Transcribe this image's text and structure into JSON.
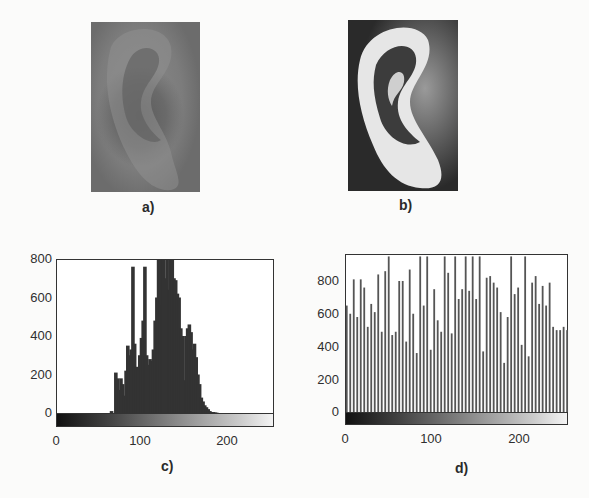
{
  "figure": {
    "panels": [
      {
        "id": "a",
        "caption": "a)",
        "description": "grayscale ear image (low contrast)"
      },
      {
        "id": "b",
        "caption": "b)",
        "description": "grayscale ear image (histogram equalized, high contrast)"
      },
      {
        "id": "c",
        "caption": "c)"
      },
      {
        "id": "d",
        "caption": "d)"
      }
    ]
  },
  "chart_data": [
    {
      "type": "bar",
      "panel": "c)",
      "title": "",
      "xlabel": "",
      "ylabel": "",
      "xlim": [
        0,
        255
      ],
      "ylim": [
        -60,
        800
      ],
      "x_ticks": [
        "0",
        "100",
        "200"
      ],
      "y_ticks": [
        "0",
        "200",
        "400",
        "600",
        "800"
      ],
      "grid": false,
      "colorbar": "grayscale 0-255 below x-axis",
      "x": [
        65,
        70,
        72,
        74,
        76,
        78,
        80,
        82,
        84,
        86,
        88,
        90,
        92,
        94,
        96,
        98,
        100,
        102,
        104,
        106,
        108,
        110,
        112,
        114,
        116,
        118,
        120,
        122,
        124,
        126,
        128,
        130,
        132,
        134,
        136,
        138,
        140,
        142,
        144,
        146,
        148,
        150,
        152,
        154,
        156,
        158,
        160,
        162,
        164,
        166,
        168,
        170,
        172,
        174,
        176,
        178,
        180,
        182,
        184,
        186,
        188,
        190
      ],
      "values": [
        10,
        210,
        180,
        120,
        180,
        150,
        90,
        220,
        350,
        300,
        330,
        760,
        360,
        240,
        230,
        300,
        390,
        480,
        760,
        300,
        250,
        280,
        270,
        330,
        480,
        600,
        800,
        800,
        560,
        800,
        700,
        800,
        640,
        800,
        800,
        700,
        690,
        620,
        600,
        440,
        400,
        170,
        400,
        440,
        460,
        420,
        330,
        360,
        290,
        200,
        150,
        80,
        60,
        40,
        30,
        20,
        10,
        5,
        5,
        3,
        2,
        0
      ]
    },
    {
      "type": "bar",
      "panel": "d)",
      "title": "",
      "xlabel": "",
      "ylabel": "",
      "xlim": [
        0,
        255
      ],
      "ylim": [
        -60,
        950
      ],
      "x_ticks": [
        "0",
        "100",
        "200"
      ],
      "y_ticks": [
        "0",
        "200",
        "400",
        "600",
        "800"
      ],
      "grid": false,
      "colorbar": "grayscale 0-255 below x-axis",
      "x": [
        2,
        6,
        10,
        14,
        18,
        22,
        26,
        30,
        34,
        38,
        42,
        46,
        50,
        54,
        58,
        62,
        66,
        70,
        74,
        78,
        82,
        86,
        90,
        94,
        98,
        102,
        106,
        110,
        114,
        118,
        122,
        126,
        130,
        134,
        138,
        142,
        146,
        150,
        154,
        158,
        162,
        166,
        170,
        174,
        178,
        182,
        186,
        190,
        194,
        198,
        202,
        206,
        210,
        214,
        218,
        222,
        226,
        230,
        234,
        238,
        242,
        246,
        250,
        254
      ],
      "values": [
        650,
        600,
        810,
        580,
        810,
        760,
        520,
        660,
        610,
        840,
        490,
        860,
        950,
        470,
        490,
        800,
        800,
        430,
        870,
        600,
        360,
        950,
        650,
        950,
        380,
        750,
        560,
        490,
        950,
        850,
        480,
        950,
        690,
        750,
        950,
        740,
        950,
        690,
        950,
        370,
        820,
        830,
        790,
        760,
        610,
        300,
        580,
        950,
        720,
        760,
        410,
        950,
        340,
        790,
        830,
        660,
        770,
        650,
        790,
        520,
        500,
        500,
        520,
        500
      ]
    }
  ]
}
